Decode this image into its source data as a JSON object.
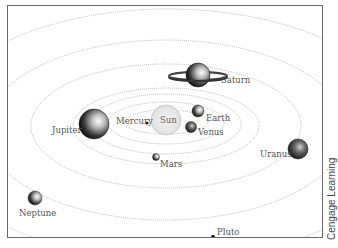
{
  "diagram": {
    "type": "solar-system",
    "center": "Sun",
    "bodies": [
      {
        "name": "Sun",
        "label": "Sun"
      },
      {
        "name": "Mercury",
        "label": "Mercury"
      },
      {
        "name": "Venus",
        "label": "Venus"
      },
      {
        "name": "Earth",
        "label": "Earth"
      },
      {
        "name": "Mars",
        "label": "Mars"
      },
      {
        "name": "Jupiter",
        "label": "Jupiter"
      },
      {
        "name": "Saturn",
        "label": "Saturn"
      },
      {
        "name": "Uranus",
        "label": "Uranus"
      },
      {
        "name": "Neptune",
        "label": "Neptune"
      },
      {
        "name": "Pluto",
        "label": "Pluto"
      }
    ],
    "orbit_style": "dotted elliptical",
    "credit": "Cengage Learning"
  }
}
